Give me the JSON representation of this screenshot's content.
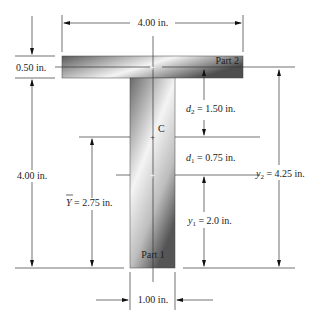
{
  "figure": {
    "parts": {
      "part1_label": "Part 1",
      "part2_label": "Part 2",
      "centroid_label": "C"
    },
    "dimensions": {
      "flange_width": "4.00 in.",
      "flange_thickness": "0.50 in.",
      "web_height": "4.00 in.",
      "web_width": "1.00 in.",
      "y_bar_symbol": "Y",
      "y_bar_value": " = 2.75 in.",
      "d2_symbol": "d",
      "d2_sub": "2",
      "d2_value": " = 1.50 in.",
      "d1_symbol": "d",
      "d1_sub": "1",
      "d1_value": " = 0.75 in.",
      "y1_symbol": "y",
      "y1_sub": "1",
      "y1_value": " = 2.0 in.",
      "y2_symbol": "y",
      "y2_sub": "2",
      "y2_value": " = 4.25 in."
    },
    "colors": {
      "section_dark": "#5a5a5a",
      "section_light": "#f2f2f2"
    }
  }
}
